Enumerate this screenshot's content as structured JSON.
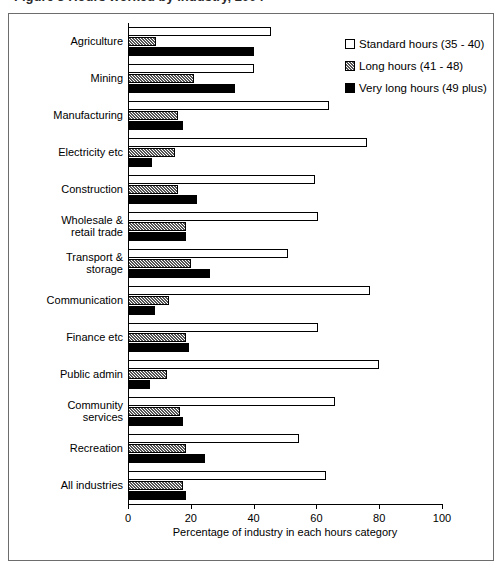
{
  "header": {
    "clipped_caption": "Figure 3 Hours worked by industry, 2004"
  },
  "chart_data": {
    "type": "bar",
    "orientation": "horizontal",
    "title": "",
    "xlabel": "Percentage of industry in each hours category",
    "ylabel": "",
    "xlim": [
      0,
      100
    ],
    "xticks": [
      0,
      20,
      40,
      60,
      80,
      100
    ],
    "grid": false,
    "legend_position": "top-right",
    "categories": [
      "Agriculture",
      "Mining",
      "Manufacturing",
      "Electricity etc",
      "Construction",
      "Wholesale &\nretail trade",
      "Transport &\nstorage",
      "Communication",
      "Finance etc",
      "Public admin",
      "Community\nservices",
      "Recreation",
      "All industries"
    ],
    "series": [
      {
        "name": "Standard hours (35 - 40)",
        "fill": "white",
        "values": [
          45.5,
          40,
          64,
          76,
          59.5,
          60.5,
          51,
          77,
          60.5,
          80,
          66,
          54.5,
          63
        ]
      },
      {
        "name": "Long hours (41 - 48)",
        "fill": "hatched",
        "values": [
          9,
          21,
          16,
          15,
          16,
          18.5,
          20,
          13,
          18.5,
          12.5,
          16.5,
          18.5,
          17.5
        ]
      },
      {
        "name": "Very long hours (49 plus)",
        "fill": "black",
        "values": [
          40,
          34,
          17.5,
          7.5,
          22,
          18.5,
          26,
          8.5,
          19.5,
          7,
          17.5,
          24.5,
          18.5
        ]
      }
    ]
  },
  "axis": {
    "tick_labels": [
      "0",
      "20",
      "40",
      "60",
      "80",
      "100"
    ]
  },
  "legend": {
    "items": [
      {
        "label": "Standard hours (35 - 40)",
        "swatch": "white-square-icon"
      },
      {
        "label": "Long hours (41 - 48)",
        "swatch": "hatched-square-icon"
      },
      {
        "label": "Very long hours (49 plus)",
        "swatch": "black-square-icon"
      }
    ]
  }
}
